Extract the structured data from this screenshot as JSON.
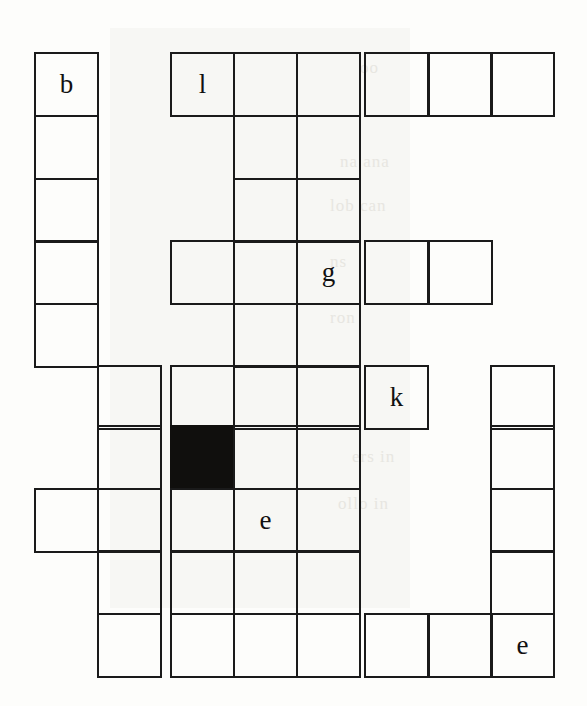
{
  "page": {
    "kind": "crossword-grid-fragment",
    "width": 587,
    "height": 706,
    "background_color": "#fdfdfb",
    "ink_color": "#1a1a1a",
    "block_color": "#100f0d",
    "letter_color": "#111111"
  },
  "grid": {
    "columns": 8,
    "rows": 10,
    "cell_size": 63,
    "origin_x": 34,
    "origin_y": 52,
    "column_x": [
      34,
      97,
      170,
      233,
      296,
      364,
      428,
      490
    ],
    "row_y": [
      52,
      115,
      178,
      240,
      303,
      365,
      425,
      488,
      550,
      613
    ],
    "letters_present": [
      "b",
      "l",
      "g",
      "k",
      "e",
      "e"
    ],
    "blocked_count": 1,
    "cells": [
      {
        "id": "c-r0-c0",
        "col": 0,
        "row": 0,
        "letter": "b",
        "blocked": false
      },
      {
        "id": "c-r1-c0",
        "col": 0,
        "row": 1,
        "letter": "",
        "blocked": false
      },
      {
        "id": "c-r2-c0",
        "col": 0,
        "row": 2,
        "letter": "",
        "blocked": false
      },
      {
        "id": "c-r3-c0",
        "col": 0,
        "row": 3,
        "letter": "",
        "blocked": false
      },
      {
        "id": "c-r4-c0",
        "col": 0,
        "row": 4,
        "letter": "",
        "blocked": false
      },
      {
        "id": "c-r7-c0",
        "col": 0,
        "row": 7,
        "letter": "",
        "blocked": false
      },
      {
        "id": "c-r5-c1",
        "col": 1,
        "row": 5,
        "letter": "",
        "blocked": false
      },
      {
        "id": "c-r6-c1",
        "col": 1,
        "row": 6,
        "letter": "",
        "blocked": false
      },
      {
        "id": "c-r7-c1",
        "col": 1,
        "row": 7,
        "letter": "",
        "blocked": false
      },
      {
        "id": "c-r8-c1",
        "col": 1,
        "row": 8,
        "letter": "",
        "blocked": false
      },
      {
        "id": "c-r9-c1",
        "col": 1,
        "row": 9,
        "letter": "",
        "blocked": false
      },
      {
        "id": "c-r0-c2",
        "col": 2,
        "row": 0,
        "letter": "l",
        "blocked": false
      },
      {
        "id": "c-r3-c2",
        "col": 2,
        "row": 3,
        "letter": "",
        "blocked": false
      },
      {
        "id": "c-r5-c2",
        "col": 2,
        "row": 5,
        "letter": "",
        "blocked": false
      },
      {
        "id": "c-r6-c2",
        "col": 2,
        "row": 6,
        "letter": "",
        "blocked": true
      },
      {
        "id": "c-r7-c2",
        "col": 2,
        "row": 7,
        "letter": "",
        "blocked": false
      },
      {
        "id": "c-r8-c2",
        "col": 2,
        "row": 8,
        "letter": "",
        "blocked": false
      },
      {
        "id": "c-r9-c2",
        "col": 2,
        "row": 9,
        "letter": "",
        "blocked": false
      },
      {
        "id": "c-r0-c3",
        "col": 3,
        "row": 0,
        "letter": "",
        "blocked": false
      },
      {
        "id": "c-r1-c3",
        "col": 3,
        "row": 1,
        "letter": "",
        "blocked": false
      },
      {
        "id": "c-r2-c3",
        "col": 3,
        "row": 2,
        "letter": "",
        "blocked": false
      },
      {
        "id": "c-r3-c3",
        "col": 3,
        "row": 3,
        "letter": "",
        "blocked": false
      },
      {
        "id": "c-r4-c3",
        "col": 3,
        "row": 4,
        "letter": "",
        "blocked": false
      },
      {
        "id": "c-r5-c3",
        "col": 3,
        "row": 5,
        "letter": "",
        "blocked": false
      },
      {
        "id": "c-r6-c3",
        "col": 3,
        "row": 6,
        "letter": "",
        "blocked": false
      },
      {
        "id": "c-r7-c3",
        "col": 3,
        "row": 7,
        "letter": "e",
        "blocked": false
      },
      {
        "id": "c-r8-c3",
        "col": 3,
        "row": 8,
        "letter": "",
        "blocked": false
      },
      {
        "id": "c-r9-c3",
        "col": 3,
        "row": 9,
        "letter": "",
        "blocked": false
      },
      {
        "id": "c-r0-c4",
        "col": 4,
        "row": 0,
        "letter": "",
        "blocked": false
      },
      {
        "id": "c-r1-c4",
        "col": 4,
        "row": 1,
        "letter": "",
        "blocked": false
      },
      {
        "id": "c-r2-c4",
        "col": 4,
        "row": 2,
        "letter": "",
        "blocked": false
      },
      {
        "id": "c-r3-c4",
        "col": 4,
        "row": 3,
        "letter": "g",
        "blocked": false
      },
      {
        "id": "c-r4-c4",
        "col": 4,
        "row": 4,
        "letter": "",
        "blocked": false
      },
      {
        "id": "c-r5-c4",
        "col": 4,
        "row": 5,
        "letter": "",
        "blocked": false
      },
      {
        "id": "c-r6-c4",
        "col": 4,
        "row": 6,
        "letter": "",
        "blocked": false
      },
      {
        "id": "c-r7-c4",
        "col": 4,
        "row": 7,
        "letter": "",
        "blocked": false
      },
      {
        "id": "c-r8-c4",
        "col": 4,
        "row": 8,
        "letter": "",
        "blocked": false
      },
      {
        "id": "c-r9-c4",
        "col": 4,
        "row": 9,
        "letter": "",
        "blocked": false
      },
      {
        "id": "c-r0-c5",
        "col": 5,
        "row": 0,
        "letter": "",
        "blocked": false
      },
      {
        "id": "c-r3-c5",
        "col": 5,
        "row": 3,
        "letter": "",
        "blocked": false
      },
      {
        "id": "c-r5-c5",
        "col": 5,
        "row": 5,
        "letter": "k",
        "blocked": false
      },
      {
        "id": "c-r9-c5",
        "col": 5,
        "row": 9,
        "letter": "",
        "blocked": false
      },
      {
        "id": "c-r0-c6",
        "col": 6,
        "row": 0,
        "letter": "",
        "blocked": false
      },
      {
        "id": "c-r3-c6",
        "col": 6,
        "row": 3,
        "letter": "",
        "blocked": false
      },
      {
        "id": "c-r9-c6",
        "col": 6,
        "row": 9,
        "letter": "",
        "blocked": false
      },
      {
        "id": "c-r0-c7",
        "col": 7,
        "row": 0,
        "letter": "",
        "blocked": false
      },
      {
        "id": "c-r5-c7",
        "col": 7,
        "row": 5,
        "letter": "",
        "blocked": false
      },
      {
        "id": "c-r6-c7",
        "col": 7,
        "row": 6,
        "letter": "",
        "blocked": false
      },
      {
        "id": "c-r7-c7",
        "col": 7,
        "row": 7,
        "letter": "",
        "blocked": false
      },
      {
        "id": "c-r8-c7",
        "col": 7,
        "row": 8,
        "letter": "",
        "blocked": false
      },
      {
        "id": "c-r9-c7",
        "col": 7,
        "row": 9,
        "letter": "e",
        "blocked": false
      }
    ]
  },
  "background_marks": {
    "panels": [
      {
        "id": "ghost-panel-upper",
        "x": 110,
        "y": 28,
        "w": 300,
        "h": 340
      },
      {
        "id": "ghost-panel-lower",
        "x": 110,
        "y": 368,
        "w": 300,
        "h": 240
      }
    ],
    "faint_show_through": [
      {
        "id": "ghost-line-1",
        "x": 360,
        "y": 58,
        "text": "oo"
      },
      {
        "id": "ghost-line-2",
        "x": 340,
        "y": 152,
        "text": "na ana"
      },
      {
        "id": "ghost-line-3",
        "x": 330,
        "y": 196,
        "text": "lob can"
      },
      {
        "id": "ghost-line-4",
        "x": 330,
        "y": 252,
        "text": "ns"
      },
      {
        "id": "ghost-line-5",
        "x": 330,
        "y": 308,
        "text": "ron"
      },
      {
        "id": "ghost-line-6",
        "x": 352,
        "y": 447,
        "text": "ers in"
      },
      {
        "id": "ghost-line-7",
        "x": 338,
        "y": 494,
        "text": "ollo in"
      }
    ]
  }
}
